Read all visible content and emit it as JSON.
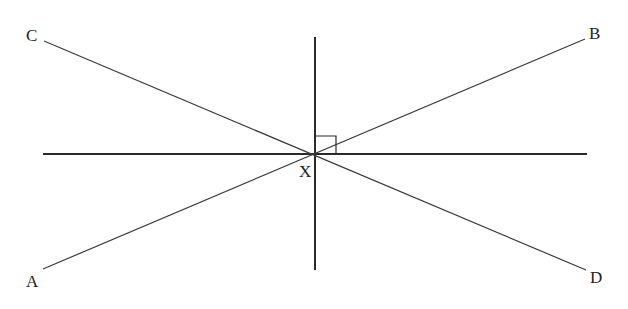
{
  "diagram": {
    "type": "intersecting-lines",
    "intersection_label": "X",
    "points": {
      "A": {
        "label": "A"
      },
      "B": {
        "label": "B"
      },
      "C": {
        "label": "C"
      },
      "D": {
        "label": "D"
      }
    },
    "right_angle_marker": true,
    "lines": [
      "AB",
      "CD",
      "horizontal",
      "vertical"
    ]
  }
}
